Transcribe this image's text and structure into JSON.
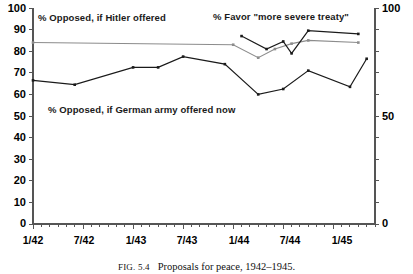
{
  "figure": {
    "caption_prefix": "FIG. 5.4",
    "caption_text": "Proposals for peace, 1942–1945."
  },
  "axes": {
    "left_ticks": [
      "100",
      "90",
      "80",
      "70",
      "60",
      "50",
      "40",
      "30",
      "20",
      "10",
      "0"
    ],
    "right_ticks": [
      "100",
      "50",
      "0"
    ],
    "x_ticks": [
      "1/42",
      "7/42",
      "1/43",
      "7/43",
      "1/44",
      "7/44",
      "1/45"
    ]
  },
  "labels": {
    "hitler": "% Opposed, if Hitler offered",
    "favor": "% Favor \"more severe treaty\"",
    "german_army": "% Opposed, if German army offered now"
  },
  "colors": {
    "hitler_line": "#8c8c8c",
    "favor_line": "#1a1a1a",
    "german_line": "#1a1a1a",
    "axis": "#555555",
    "text": "#000000"
  },
  "chart_data": {
    "type": "line",
    "xlabel": "",
    "ylabel": "",
    "ylim": [
      0,
      100
    ],
    "y_ticks": [
      0,
      10,
      20,
      30,
      40,
      50,
      60,
      70,
      80,
      90,
      100
    ],
    "right_axis_ticks": [
      0,
      50,
      100
    ],
    "xlim": [
      "1/42",
      "5/45"
    ],
    "x_tick_labels": [
      "1/42",
      "7/42",
      "1/43",
      "7/43",
      "1/44",
      "7/44",
      "1/45"
    ],
    "x_minor_tick_interval_months": 1,
    "x_major_tick_interval_months": 6,
    "grid": false,
    "legend": "inline-annotations",
    "series": [
      {
        "name": "% Opposed, if Hitler offered",
        "color": "#8c8c8c",
        "marker": "small-square",
        "points": [
          {
            "x": "1/42",
            "y": 84.0
          },
          {
            "x": "1/44",
            "y": 83.0
          },
          {
            "x": "4/44",
            "y": 77.0
          },
          {
            "x": "6/44",
            "y": 81.0
          },
          {
            "x": "8/44",
            "y": 83.5
          },
          {
            "x": "10/44",
            "y": 85.0
          },
          {
            "x": "4/45",
            "y": 84.0
          }
        ]
      },
      {
        "name": "% Favor \"more severe treaty\"",
        "color": "#1a1a1a",
        "marker": "small-square",
        "points": [
          {
            "x": "2/44",
            "y": 87.0
          },
          {
            "x": "5/44",
            "y": 81.0
          },
          {
            "x": "7/44",
            "y": 84.5
          },
          {
            "x": "8/44",
            "y": 79.0
          },
          {
            "x": "10/44",
            "y": 89.5
          },
          {
            "x": "4/45",
            "y": 88.0
          }
        ]
      },
      {
        "name": "% Opposed, if German army offered now",
        "color": "#1a1a1a",
        "marker": "small-square",
        "points": [
          {
            "x": "1/42",
            "y": 66.5
          },
          {
            "x": "6/42",
            "y": 64.5
          },
          {
            "x": "1/43",
            "y": 72.5
          },
          {
            "x": "4/43",
            "y": 72.5
          },
          {
            "x": "7/43",
            "y": 77.5
          },
          {
            "x": "12/43",
            "y": 74.0
          },
          {
            "x": "4/44",
            "y": 60.0
          },
          {
            "x": "7/44",
            "y": 62.5
          },
          {
            "x": "10/44",
            "y": 71.0
          },
          {
            "x": "3/45",
            "y": 63.5
          },
          {
            "x": "5/45",
            "y": 76.5
          }
        ]
      }
    ]
  }
}
